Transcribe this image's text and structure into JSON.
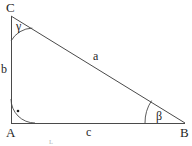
{
  "figure": {
    "type": "right-triangle-diagram",
    "background_color": "#ffffff",
    "stroke_color": "#4a4a4a",
    "text_color": "#1f1f1f",
    "vertices": {
      "C": {
        "label": "C",
        "x": 11,
        "y": 16
      },
      "A": {
        "label": "A",
        "x": 11,
        "y": 123
      },
      "B": {
        "label": "B",
        "x": 185,
        "y": 123
      }
    },
    "sides": {
      "a": {
        "label": "a",
        "from": "C",
        "to": "B",
        "description": "hypotenuse"
      },
      "b": {
        "label": "b",
        "from": "C",
        "to": "A",
        "description": "vertical leg"
      },
      "c": {
        "label": "c",
        "from": "A",
        "to": "B",
        "description": "horizontal leg"
      }
    },
    "angles": {
      "gamma": {
        "label": "γ",
        "at": "C",
        "arc_radius": 25
      },
      "alpha": {
        "label": "",
        "at": "A",
        "arc_radius": 24,
        "marker": "right-angle-dot"
      },
      "beta": {
        "label": "β",
        "at": "B",
        "arc_radius": 40
      }
    },
    "edge_mark": {
      "label": "ʟ"
    }
  }
}
